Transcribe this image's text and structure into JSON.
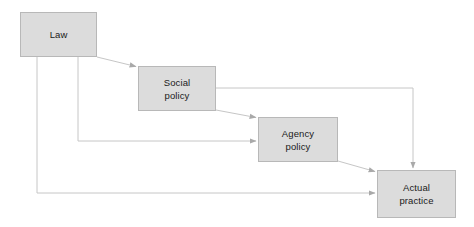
{
  "diagram": {
    "type": "flow-chart",
    "canvas": {
      "width": 474,
      "height": 227,
      "background": "#ffffff"
    },
    "style": {
      "node_fill": "#dcdcdc",
      "node_border": "#b8b8b8",
      "node_text": "#1a1a1a",
      "connector": "#c6c6c6"
    },
    "nodes": [
      {
        "id": "law",
        "label": "Law",
        "x": 20,
        "y": 12,
        "width": 77,
        "height": 45
      },
      {
        "id": "social",
        "label": "Social\npolicy",
        "x": 138,
        "y": 66,
        "width": 78,
        "height": 45
      },
      {
        "id": "agency",
        "label": "Agency\npolicy",
        "x": 258,
        "y": 117,
        "width": 80,
        "height": 45
      },
      {
        "id": "actual",
        "label": "Actual\npractice",
        "x": 377,
        "y": 170,
        "width": 79,
        "height": 48
      }
    ],
    "connectors": [
      {
        "id": "law-to-social",
        "from": "law",
        "to": "social",
        "kind": "diagonal"
      },
      {
        "id": "law-to-agency",
        "from": "law",
        "to": "agency",
        "kind": "orthogonal"
      },
      {
        "id": "law-to-actual",
        "from": "law",
        "to": "actual",
        "kind": "orthogonal"
      },
      {
        "id": "social-to-agency",
        "from": "social",
        "to": "agency",
        "kind": "diagonal"
      },
      {
        "id": "social-to-actual",
        "from": "social",
        "to": "actual",
        "kind": "orthogonal"
      },
      {
        "id": "agency-to-actual",
        "from": "agency",
        "to": "actual",
        "kind": "diagonal"
      }
    ]
  }
}
